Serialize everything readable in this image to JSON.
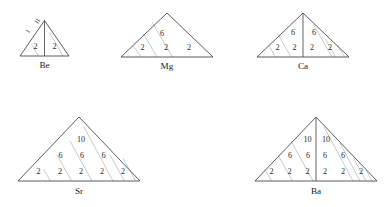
{
  "figure": {
    "background_color": "#ffffff",
    "outline_color": "#4a4a4a",
    "hatch_color": "#bdbdbd",
    "center_line_color": "#555555",
    "text_color": "#1a1a1a"
  },
  "diagrams": [
    {
      "id": "be",
      "element_label": "Be",
      "symmetric": true,
      "rows": [
        {
          "left": [
            "2"
          ],
          "right": [
            "2"
          ]
        }
      ],
      "edge_labels": [
        "1",
        "II"
      ],
      "all_numbers": [
        "2",
        "2"
      ]
    },
    {
      "id": "mg",
      "element_label": "Mg",
      "symmetric": false,
      "rows": [
        {
          "left": [],
          "right": [
            "6"
          ]
        },
        {
          "left": [],
          "right": [
            "2",
            "2",
            "2"
          ]
        }
      ],
      "edge_labels": [],
      "all_numbers": [
        "6",
        "2",
        "2",
        "2"
      ]
    },
    {
      "id": "ca",
      "element_label": "Ca",
      "symmetric": true,
      "rows": [
        {
          "left": [
            "6"
          ],
          "right": [
            "6"
          ]
        },
        {
          "left": [
            "2",
            "2"
          ],
          "right": [
            "2",
            "2"
          ]
        }
      ],
      "edge_labels": [],
      "all_numbers": [
        "6",
        "6",
        "2",
        "2",
        "2",
        "2"
      ]
    },
    {
      "id": "sr",
      "element_label": "Sr",
      "symmetric": false,
      "rows": [
        {
          "left": [],
          "right": [
            "10"
          ]
        },
        {
          "left": [],
          "right": [
            "6",
            "6",
            "6"
          ]
        },
        {
          "left": [],
          "right": [
            "2",
            "2",
            "2",
            "2",
            "2"
          ]
        }
      ],
      "edge_labels": [],
      "all_numbers": [
        "10",
        "6",
        "6",
        "6",
        "2",
        "2",
        "2",
        "2",
        "2"
      ]
    },
    {
      "id": "ba",
      "element_label": "Ba",
      "symmetric": true,
      "rows": [
        {
          "left": [
            "10"
          ],
          "right": [
            "10"
          ]
        },
        {
          "left": [
            "6",
            "6"
          ],
          "right": [
            "6",
            "6"
          ]
        },
        {
          "left": [
            "2",
            "2",
            "2"
          ],
          "right": [
            "2",
            "2",
            "2"
          ]
        }
      ],
      "edge_labels": [],
      "all_numbers": [
        "10",
        "10",
        "6",
        "6",
        "6",
        "6",
        "2",
        "2",
        "2",
        "2",
        "2",
        "2"
      ]
    }
  ]
}
